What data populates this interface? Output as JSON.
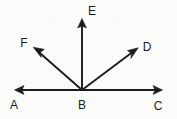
{
  "figure": {
    "type": "geometry-ray-diagram",
    "background_color": "#fbfbfa",
    "stroke_color": "#1c1c1c",
    "label_color": "#1c1c1c",
    "width": 177,
    "height": 119,
    "vertex": {
      "name": "B",
      "x": 82,
      "y": 90
    },
    "labels": [
      {
        "id": "label-a",
        "text": "A",
        "x": 14,
        "y": 105
      },
      {
        "id": "label-b",
        "text": "B",
        "x": 82,
        "y": 105
      },
      {
        "id": "label-c",
        "text": "C",
        "x": 158,
        "y": 106
      },
      {
        "id": "label-d",
        "text": "D",
        "x": 147,
        "y": 47
      },
      {
        "id": "label-e",
        "text": "E",
        "x": 92,
        "y": 11
      },
      {
        "id": "label-f",
        "text": "F",
        "x": 24,
        "y": 43
      }
    ],
    "rays": [
      {
        "id": "ray-ba",
        "endpoint_label": "A",
        "from_x": 82,
        "from_y": 90,
        "to_x": 15,
        "to_y": 90,
        "arrow": true
      },
      {
        "id": "ray-bc",
        "endpoint_label": "C",
        "from_x": 82,
        "from_y": 90,
        "to_x": 162,
        "to_y": 90,
        "arrow": true
      },
      {
        "id": "ray-be",
        "endpoint_label": "E",
        "from_x": 82,
        "from_y": 90,
        "to_x": 82,
        "to_y": 19,
        "arrow": true
      },
      {
        "id": "ray-bd",
        "endpoint_label": "D",
        "from_x": 82,
        "from_y": 90,
        "to_x": 138,
        "to_y": 48,
        "arrow": true
      },
      {
        "id": "ray-bf",
        "endpoint_label": "F",
        "from_x": 82,
        "from_y": 90,
        "to_x": 33,
        "to_y": 47,
        "arrow": true
      }
    ]
  }
}
